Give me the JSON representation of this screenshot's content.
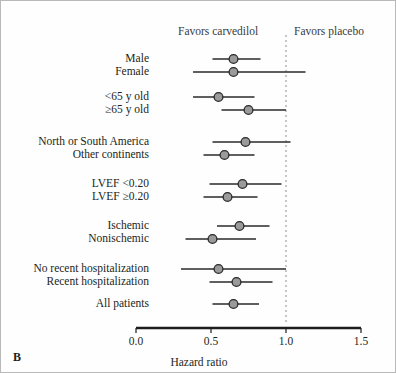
{
  "panel": {
    "letter": "B",
    "header_left": "Favors carvedilol",
    "header_right": "Favors placebo",
    "axis_title": "Hazard ratio"
  },
  "axis": {
    "ticks": [
      "0.0",
      "0.5",
      "1.0",
      "1.5"
    ],
    "tick_values": [
      0.0,
      0.5,
      1.0,
      1.5
    ],
    "reference_line": 1.0
  },
  "chart_data": {
    "type": "scatter",
    "title": "",
    "subtitle": "",
    "xlabel": "Hazard ratio",
    "ylabel": "",
    "xlim": [
      0.0,
      1.5
    ],
    "grid": false,
    "legend": "none",
    "orientation": "horizontal-forest",
    "reference_line": 1.0,
    "annotations": [
      "Favors carvedilol",
      "Favors placebo"
    ],
    "categories": [
      "Male",
      "Female",
      "<65 y old",
      "≥65 y old",
      "North or South America",
      "Other continents",
      "LVEF <0.20",
      "LVEF ≥0.20",
      "Ischemic",
      "Nonischemic",
      "No recent hospitalization",
      "Recent hospitalization",
      "All patients"
    ],
    "series": [
      {
        "name": "Hazard ratio (95% CI)",
        "values": [
          0.65,
          0.65,
          0.55,
          0.75,
          0.73,
          0.59,
          0.71,
          0.61,
          0.69,
          0.51,
          0.55,
          0.67,
          0.65
        ],
        "ci_low": [
          0.51,
          0.38,
          0.38,
          0.57,
          0.51,
          0.45,
          0.49,
          0.45,
          0.54,
          0.33,
          0.3,
          0.49,
          0.51
        ],
        "ci_high": [
          0.83,
          1.13,
          0.79,
          1.0,
          1.03,
          0.79,
          0.97,
          0.81,
          0.89,
          0.8,
          1.0,
          0.91,
          0.82
        ]
      }
    ],
    "rows": [
      {
        "label": "Male",
        "hr": 0.65,
        "low": 0.51,
        "high": 0.83,
        "group": 1
      },
      {
        "label": "Female",
        "hr": 0.65,
        "low": 0.38,
        "high": 1.13,
        "group": 1
      },
      {
        "label": "<65 y old",
        "hr": 0.55,
        "low": 0.38,
        "high": 0.79,
        "group": 2
      },
      {
        "label": "≥65 y old",
        "hr": 0.75,
        "low": 0.57,
        "high": 1.0,
        "group": 2
      },
      {
        "label": "North or South America",
        "hr": 0.73,
        "low": 0.51,
        "high": 1.03,
        "group": 3
      },
      {
        "label": "Other continents",
        "hr": 0.59,
        "low": 0.45,
        "high": 0.79,
        "group": 3
      },
      {
        "label": "LVEF <0.20",
        "hr": 0.71,
        "low": 0.49,
        "high": 0.97,
        "group": 4
      },
      {
        "label": "LVEF ≥0.20",
        "hr": 0.61,
        "low": 0.45,
        "high": 0.81,
        "group": 4
      },
      {
        "label": "Ischemic",
        "hr": 0.69,
        "low": 0.54,
        "high": 0.89,
        "group": 5
      },
      {
        "label": "Nonischemic",
        "hr": 0.51,
        "low": 0.33,
        "high": 0.8,
        "group": 5
      },
      {
        "label": "No recent hospitalization",
        "hr": 0.55,
        "low": 0.3,
        "high": 1.0,
        "group": 6
      },
      {
        "label": "Recent hospitalization",
        "hr": 0.67,
        "low": 0.49,
        "high": 0.91,
        "group": 6
      },
      {
        "label": "All patients",
        "hr": 0.65,
        "low": 0.51,
        "high": 0.82,
        "group": 7
      }
    ]
  },
  "colors": {
    "marker_fill": "#9a9a9a",
    "marker_stroke": "#2a2a2a",
    "whisker": "#2a2a2a",
    "axis": "#1d1d1d",
    "reference_dash": "#8e8e8e",
    "border": "#b9b9b9",
    "text": "#231f20"
  }
}
